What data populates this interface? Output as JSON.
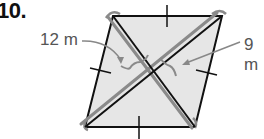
{
  "problem": {
    "number": "10.",
    "label_left": "12 m",
    "label_right": "9 m"
  },
  "figure": {
    "shape": "parallelogram",
    "fill": "#e6e6e6",
    "stroke": "#111111",
    "highlight": "#888888",
    "vertices": {
      "top_left": [
        113,
        16
      ],
      "top_right": [
        222,
        16
      ],
      "bottom_right": [
        195,
        127
      ],
      "bottom_left": [
        85,
        127
      ]
    }
  }
}
